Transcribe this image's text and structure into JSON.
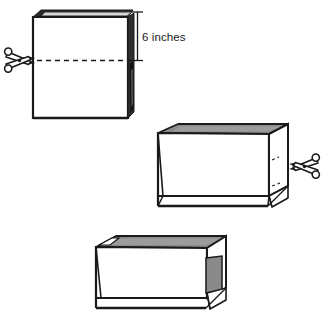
{
  "illustration": {
    "title": "Paper bag cut-down to make an open box",
    "background_color": "#ffffff",
    "ink_color": "#1a1a1a",
    "shade_color": "#8a8a8a",
    "shade_color_light": "#b4b4b4"
  },
  "annotations": {
    "dimension_label": "6 inches"
  },
  "figures": [
    {
      "id": "figure-tall-bag",
      "caption": "Tall paper bag with dashed cut line",
      "parts": {
        "cut_line": "dashed-cut-line",
        "scissors": "scissors-icon",
        "dimension": "6 inches"
      }
    },
    {
      "id": "figure-cut-bag",
      "caption": "Cut-down open bag with side gusset and scissors",
      "parts": {
        "scissors": "scissors-icon"
      }
    },
    {
      "id": "figure-finished-box",
      "caption": "Finished open box with folded side flap"
    }
  ],
  "icons": {
    "scissors_left": "scissors-icon",
    "scissors_right": "scissors-icon"
  }
}
